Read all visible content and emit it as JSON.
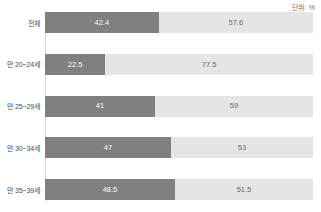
{
  "unit_note": "단위: %",
  "chart_data": {
    "type": "bar",
    "title": "",
    "subtitle": "",
    "xlabel": "",
    "ylabel": "",
    "orientation": "horizontal",
    "stacked": true,
    "stack_total": 100,
    "xlim": [
      0,
      100
    ],
    "grid": false,
    "legend_position": "none",
    "unit": "%",
    "unit_label": "단위: %",
    "categories": [
      "전체",
      "만 20~24세",
      "만 25~29세",
      "만 30~34세",
      "만 35~39세"
    ],
    "series": [
      {
        "name": "",
        "color": "#808080",
        "values": [
          42.4,
          22.5,
          41,
          47,
          48.5
        ],
        "labels": [
          "42.4",
          "22.5",
          "41",
          "47",
          "48.5"
        ]
      },
      {
        "name": "",
        "color": "#e5e5e5",
        "values": [
          57.6,
          77.5,
          59,
          53,
          51.5
        ],
        "labels": [
          "57.6",
          "77.5",
          "59",
          "53",
          "51.5"
        ]
      }
    ]
  },
  "colors": {
    "segment_primary": "#808080",
    "segment_secondary": "#e5e5e5",
    "axis_line": "#d8d8d8",
    "label_text": "#4a4a4a",
    "value_text_light": "#ffffff",
    "value_text_dark": "#6b6b6b",
    "background": "#ffffff"
  }
}
